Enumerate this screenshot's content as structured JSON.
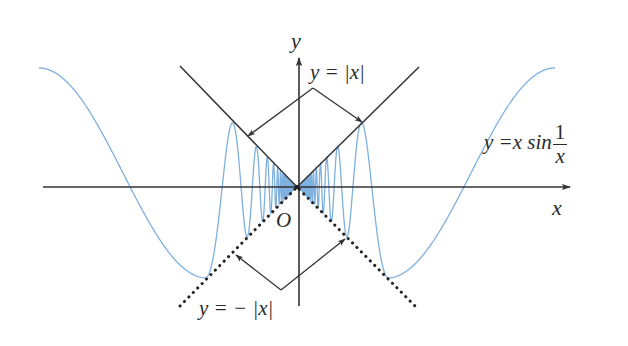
{
  "diagram": {
    "colors": {
      "axis": "#333333",
      "curve": "#7eb0e0",
      "bound_line": "#333333",
      "background": "#ffffff"
    },
    "origin_px": [
      297,
      187
    ],
    "axes": {
      "x_axis": {
        "from": [
          43,
          187
        ],
        "to": [
          570,
          187
        ],
        "label": "x"
      },
      "y_axis": {
        "from": [
          299,
          306
        ],
        "to": [
          299,
          58
        ],
        "label": "y"
      },
      "origin_label": "O"
    },
    "bounds": {
      "upper": {
        "equation": "y = |x|",
        "style": "solid",
        "left_end": [
          180,
          66
        ],
        "right_end": [
          419,
          67
        ]
      },
      "lower": {
        "equation": "y = − |x|",
        "style": "dotted",
        "left_end": [
          180,
          306
        ],
        "right_end": [
          417,
          308
        ]
      }
    },
    "curve": {
      "equation": "y = x sin(1/x)",
      "label_prefix": "y =x  sin",
      "label_num": "1",
      "label_den": "x",
      "inner_a": 696,
      "inner_phase": -3.021,
      "inner_cutoff_px": 90,
      "outer_min_px": [
        90,
        91
      ],
      "outer_end_px": [
        258,
        -119
      ]
    },
    "labels": {
      "y_axis": "y",
      "x_axis": "x",
      "origin": "O",
      "upper_bound": "y = |x|",
      "lower_bound": "y = − |x|",
      "curve_prefix": "y =x  sin",
      "curve_num": "1",
      "curve_den": "x"
    },
    "callouts": {
      "upper": {
        "vertex": [
          313,
          88
        ],
        "left_tip": [
          248,
          136
        ],
        "right_tip": [
          362,
          122
        ]
      },
      "lower": {
        "vertex": [
          281,
          290
        ],
        "left_tip": [
          236,
          255
        ],
        "right_tip": [
          345,
          239
        ]
      }
    }
  }
}
